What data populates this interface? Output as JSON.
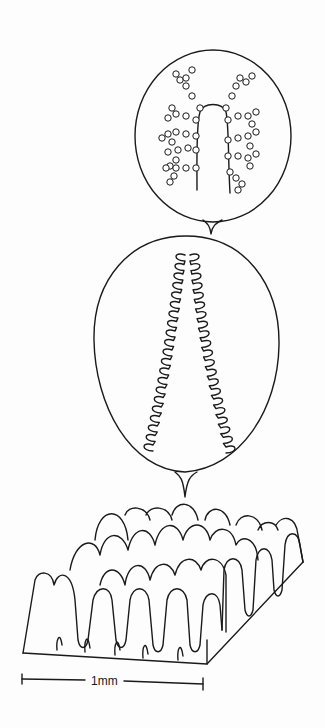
{
  "figure": {
    "type": "scientific line drawing",
    "panels": [
      {
        "id": "top",
        "description": "circular cross-section with branched beaded structures around central lumen"
      },
      {
        "id": "middle",
        "description": "oval section with folded (looped) lining around elongated central cavity"
      },
      {
        "id": "bottom",
        "description": "3D block of surface with rows of finger-like projections"
      }
    ],
    "scale_bar": {
      "label": "1mm"
    }
  }
}
